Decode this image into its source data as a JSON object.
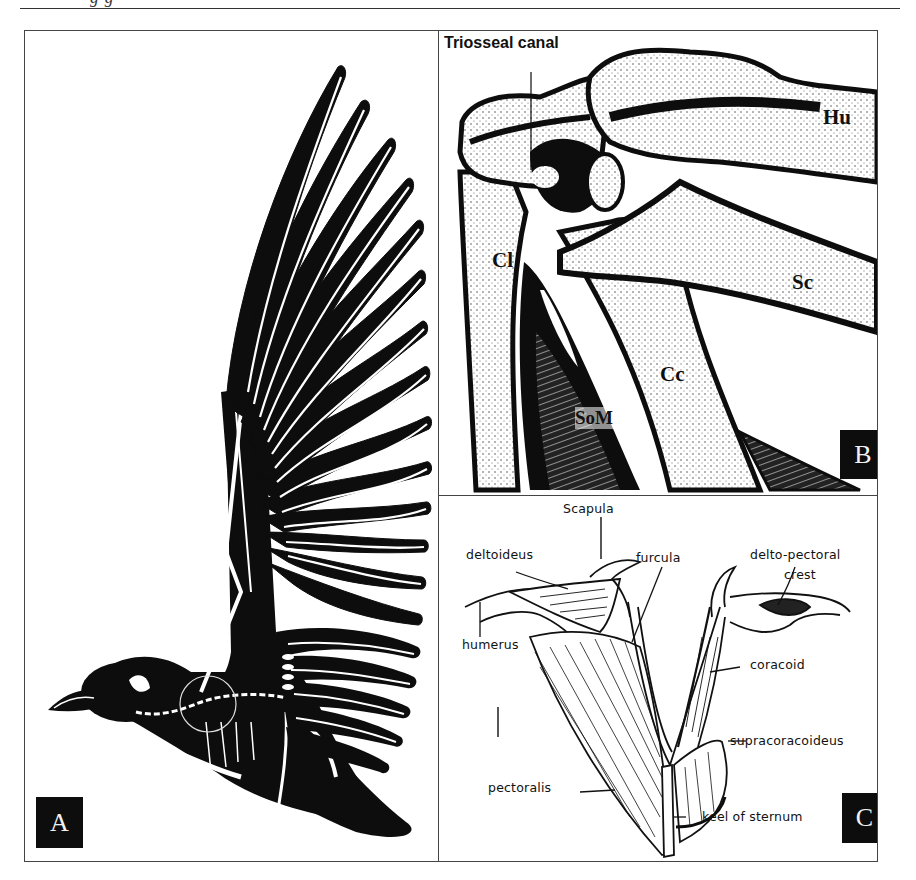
{
  "page": {
    "running_header_fragment": "g              g"
  },
  "figure": {
    "panels": [
      {
        "id": "A",
        "label": "A",
        "description": "Silhouette of a bird in flight with wing raised, skeleton shown in white outline; circled shoulder region"
      },
      {
        "id": "B",
        "label": "B",
        "description": "Stippled drawing of bird shoulder joint bones",
        "annotations": {
          "triosseal_canal": "Triosseal canal",
          "humerus": "Hu",
          "clavicle": "Cl",
          "scapula": "Sc",
          "coracoid": "Cc",
          "supracoracoideus_muscle": "SoM"
        }
      },
      {
        "id": "C",
        "label": "C",
        "description": "Line drawing of pectoral girdle and flight muscles",
        "annotations": {
          "scapula": "Scapula",
          "deltoideus": "deltoideus",
          "furcula": "furcula",
          "delto_pectoral_line1": "delto-pectoral",
          "delto_pectoral_line2": "crest",
          "humerus": "humerus",
          "coracoid": "coracoid",
          "supracoracoideus": "supracoracoideus",
          "pectoralis": "pectoralis",
          "keel": "keel of sternum"
        }
      }
    ]
  },
  "colors": {
    "ink": "#0d0d0d",
    "paper": "#ffffff",
    "rule": "#444444"
  }
}
